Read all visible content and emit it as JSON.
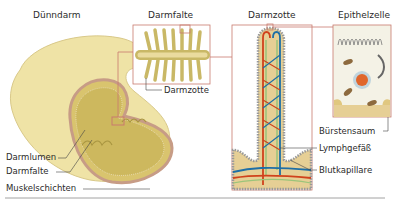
{
  "diagram": {
    "panels": [
      {
        "id": "duenndarm",
        "title": "Dünndarm"
      },
      {
        "id": "darmfalte",
        "title": "Darmfalte"
      },
      {
        "id": "darmzotte",
        "title": "Darmzotte"
      },
      {
        "id": "epithelzelle",
        "title": "Epithelzelle"
      }
    ],
    "labels": {
      "darmlumen": "Darmlumen",
      "darmfalte": "Darmfalte",
      "muskelschichten": "Muskelschichten",
      "darmzotte": "Darmzotte",
      "buerstensaum": "Bürstensaum",
      "lymphgefaess": "Lymphgefäß",
      "blutkapillare": "Blutkapillare"
    },
    "colors": {
      "tissue": "#e9dc9b",
      "tissue_dark": "#c9b866",
      "wall": "#c79c86",
      "frame": "#c97a6e",
      "blood": "#d0421c",
      "lymph": "#1f6fa6",
      "green": "#9bc47a",
      "leader": "#444444"
    }
  }
}
